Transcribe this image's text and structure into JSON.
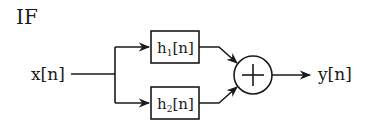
{
  "title": "IF",
  "input": {
    "label": "x[n]"
  },
  "output": {
    "label": "y[n]"
  },
  "blocks": [
    {
      "name": "h",
      "sub": "1",
      "suffix": "[n]"
    },
    {
      "name": "h",
      "sub": "2",
      "suffix": "[n]"
    }
  ],
  "summer": {
    "symbol": "+"
  },
  "colors": {
    "stroke": "#1a1a1a",
    "background": "#ffffff"
  }
}
